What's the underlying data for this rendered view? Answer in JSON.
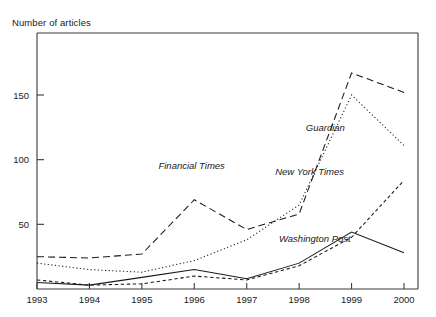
{
  "chart_data": {
    "type": "line",
    "title": "",
    "ylabel": "Number of articles",
    "xlabel": "",
    "x": [
      1993,
      1994,
      1995,
      1996,
      1997,
      1998,
      1999,
      2000
    ],
    "xtick_labels": [
      "1993",
      "1994",
      "1995",
      "1996",
      "1997",
      "1998",
      "1999",
      "2000"
    ],
    "ytick_labels": [
      "50",
      "100",
      "150"
    ],
    "yticks": [
      50,
      100,
      150
    ],
    "ylim": [
      0,
      185
    ],
    "xlim": [
      1993,
      2000
    ],
    "grid": false,
    "legend": "inline-labels",
    "series": [
      {
        "name": "Financial Times",
        "style": "dashed",
        "label_x": 1995.95,
        "label_y": 93,
        "values": [
          25,
          24,
          27,
          69,
          46,
          58,
          167,
          152
        ]
      },
      {
        "name": "Guardian",
        "style": "dotted",
        "label_x": 1998.5,
        "label_y": 122,
        "values": [
          20,
          15,
          13,
          22,
          38,
          65,
          150,
          111
        ]
      },
      {
        "name": "New York Times",
        "style": "short-dashed",
        "label_x": 1998.2,
        "label_y": 88,
        "values": [
          7,
          3,
          4,
          10,
          7,
          18,
          40,
          84
        ]
      },
      {
        "name": "Washington Post",
        "style": "solid",
        "label_x": 1998.3,
        "label_y": 36,
        "values": [
          5,
          3,
          9,
          15,
          8,
          20,
          44,
          28
        ]
      }
    ]
  }
}
